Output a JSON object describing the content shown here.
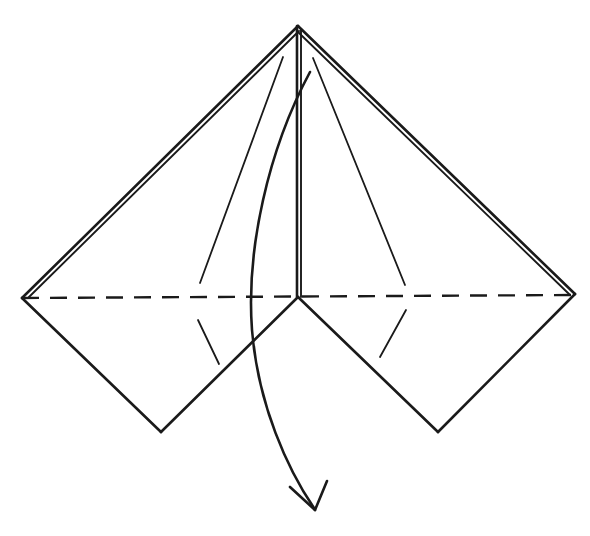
{
  "diagram": {
    "background_color": "#ffffff",
    "line_color": "#1a1a1a",
    "canvas": {
      "width": 590,
      "height": 536
    },
    "key_points": {
      "apex": {
        "label": "apex",
        "x": 298,
        "y": 26
      },
      "left_vertex": {
        "label": "left-vertex",
        "x": 22,
        "y": 298
      },
      "right_vertex": {
        "label": "right-vertex",
        "x": 575,
        "y": 294
      },
      "center": {
        "label": "center-vertex",
        "x": 298,
        "y": 297
      },
      "bottom_left_vertex": {
        "label": "bottom-left-vertex",
        "x": 161,
        "y": 432
      },
      "bottom_right_vertex": {
        "label": "bottom-right-vertex",
        "x": 438,
        "y": 432
      },
      "arrow_tip": {
        "label": "arrow-tip",
        "x": 314,
        "y": 510
      }
    },
    "paths": {
      "outer_left_upper_a": "M 298 26 L 22 298",
      "outer_left_upper_b": "M 299 31 L 29 297",
      "outer_right_upper_a": "M 298 26 L 575 294",
      "outer_right_upper_b": "M 298 32 L 569 294",
      "outer_left_lower": "M 22 298 L 161 432",
      "outer_right_lower": "M 575 294 L 438 432",
      "inner_left_lower": "M 298 297 L 161 432",
      "inner_right_lower": "M 298 297 L 438 432",
      "center_vertical_a": "M 297 26 L 297 297",
      "center_vertical_b": "M 301 30 L 301 297",
      "hidden_horizontal": "M 22 298 L 575 295",
      "crease_left_upper": "M 283 57 L 200 283",
      "crease_right_upper": "M 313 58 L 405 285",
      "crease_left_lower": "M 198 320 L 219 364",
      "crease_right_lower": "M 380 357 L 406 310",
      "arrow_curve": "M 310 72 C 268 150 246 250 252 330 C 258 405 288 470 314 508",
      "arrow_head_left": "M 290 487 L 315 510",
      "arrow_head_right": "M 327 481 L 315 510"
    },
    "strokes": {
      "solid_edge_width": 2.6,
      "inner_edge_width": 1.9,
      "thin_crease_width": 1.8,
      "hidden_edge_width": 2.4,
      "hidden_dash_pattern": "17 11"
    },
    "legend": {
      "solid_line_meaning": "visible paper edge",
      "dashed_line_meaning": "hidden edge behind the paper",
      "thin_line_meaning": "existing crease line",
      "arrow_meaning": "fold the flap downward in the direction of the arrow"
    }
  }
}
